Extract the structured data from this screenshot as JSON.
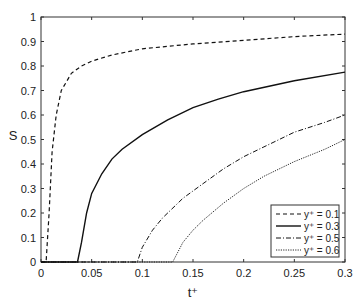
{
  "chart_data": {
    "type": "line",
    "title": "",
    "xlabel": "t⁺",
    "ylabel": "S",
    "xlim": [
      0,
      0.3
    ],
    "ylim": [
      0,
      1
    ],
    "xticks": [
      "0",
      "0.05",
      "0.1",
      "0.15",
      "0.2",
      "0.25",
      "0.3"
    ],
    "yticks": [
      "0",
      "0.1",
      "0.2",
      "0.3",
      "0.4",
      "0.5",
      "0.6",
      "0.7",
      "0.8",
      "0.9",
      "1"
    ],
    "grid": false,
    "legend_position": "lower right",
    "series": [
      {
        "name": "y⁺ = 0.1",
        "style": "dashed",
        "x": [
          0.0,
          0.005,
          0.008,
          0.011,
          0.015,
          0.02,
          0.03,
          0.04,
          0.05,
          0.07,
          0.1,
          0.15,
          0.2,
          0.25,
          0.3
        ],
        "y": [
          0.0,
          0.0,
          0.2,
          0.45,
          0.6,
          0.7,
          0.77,
          0.8,
          0.82,
          0.845,
          0.87,
          0.89,
          0.905,
          0.92,
          0.93
        ]
      },
      {
        "name": "y⁺ = 0.3",
        "style": "solid",
        "x": [
          0.0,
          0.036,
          0.04,
          0.045,
          0.05,
          0.06,
          0.07,
          0.08,
          0.1,
          0.125,
          0.15,
          0.175,
          0.2,
          0.25,
          0.3
        ],
        "y": [
          0.0,
          0.0,
          0.08,
          0.2,
          0.28,
          0.36,
          0.42,
          0.46,
          0.52,
          0.58,
          0.63,
          0.665,
          0.695,
          0.74,
          0.775
        ]
      },
      {
        "name": "y⁺ = 0.5",
        "style": "dashdot",
        "x": [
          0.0,
          0.095,
          0.1,
          0.11,
          0.12,
          0.14,
          0.16,
          0.18,
          0.2,
          0.22,
          0.25,
          0.28,
          0.3
        ],
        "y": [
          0.0,
          0.0,
          0.06,
          0.13,
          0.18,
          0.26,
          0.32,
          0.38,
          0.43,
          0.47,
          0.53,
          0.57,
          0.6
        ]
      },
      {
        "name": "y⁺ = 0.6",
        "style": "dotted",
        "x": [
          0.0,
          0.13,
          0.135,
          0.14,
          0.15,
          0.16,
          0.18,
          0.2,
          0.22,
          0.25,
          0.28,
          0.3
        ],
        "y": [
          0.0,
          0.0,
          0.04,
          0.08,
          0.13,
          0.17,
          0.24,
          0.3,
          0.35,
          0.41,
          0.46,
          0.5
        ]
      }
    ]
  }
}
